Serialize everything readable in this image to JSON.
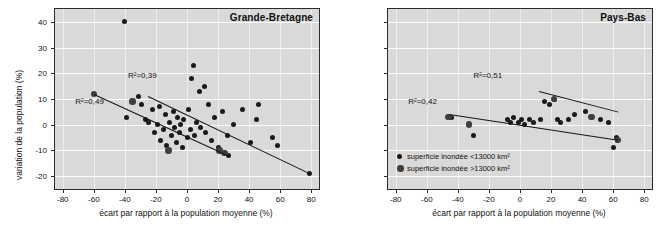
{
  "chart_data": [
    {
      "type": "scatter",
      "title": "Grande-Bretagne",
      "xlabel": "écart par rapport à la population moyenne (%)",
      "ylabel": "variation de la population (%)",
      "xlim": [
        -85,
        85
      ],
      "ylim": [
        -25,
        45
      ],
      "xticks": [
        -80,
        -60,
        -40,
        -20,
        0,
        20,
        40,
        60,
        80
      ],
      "xticklabels": [
        "-80",
        "-60",
        "-40",
        "-20",
        "0",
        "20",
        "40",
        "60",
        "80"
      ],
      "yticks": [
        -20,
        -10,
        0,
        10,
        20,
        30,
        40
      ],
      "yticklabels": [
        "-20",
        "-10",
        "0",
        "10",
        "20",
        "30",
        "40"
      ],
      "grid": true,
      "legend": "none",
      "series": [
        {
          "name": "superficie inondée <13000 km2",
          "marker": "small",
          "points": [
            [
              -40,
              40
            ],
            [
              -39,
              3
            ],
            [
              -31,
              11
            ],
            [
              -29,
              8
            ],
            [
              -27,
              2
            ],
            [
              -25,
              1
            ],
            [
              -22,
              6
            ],
            [
              -21,
              -3
            ],
            [
              -19,
              0
            ],
            [
              -18,
              7
            ],
            [
              -17,
              -6
            ],
            [
              -15,
              -2
            ],
            [
              -14,
              4
            ],
            [
              -13,
              -8
            ],
            [
              -11,
              1
            ],
            [
              -10,
              -4
            ],
            [
              -9,
              5
            ],
            [
              -8,
              -1
            ],
            [
              -7,
              -7
            ],
            [
              -6,
              3
            ],
            [
              -5,
              -3
            ],
            [
              -4,
              0
            ],
            [
              -3,
              -9
            ],
            [
              -2,
              2
            ],
            [
              0,
              -5
            ],
            [
              1,
              6
            ],
            [
              2,
              -2
            ],
            [
              3,
              18
            ],
            [
              4,
              23
            ],
            [
              5,
              -4
            ],
            [
              6,
              1
            ],
            [
              8,
              13
            ],
            [
              9,
              -1
            ],
            [
              11,
              15
            ],
            [
              12,
              -3
            ],
            [
              14,
              8
            ],
            [
              16,
              -6
            ],
            [
              18,
              3
            ],
            [
              20,
              -9
            ],
            [
              23,
              5
            ],
            [
              26,
              -4
            ],
            [
              27,
              -12
            ],
            [
              30,
              0
            ],
            [
              36,
              6
            ],
            [
              41,
              -7
            ],
            [
              45,
              2
            ],
            [
              46,
              8
            ],
            [
              55,
              -5
            ],
            [
              58,
              -8
            ],
            [
              79,
              -19
            ]
          ]
        },
        {
          "name": "superficie inondée >13000 km2",
          "marker": "large",
          "points": [
            [
              -60,
              12
            ],
            [
              -35,
              9
            ],
            [
              -12,
              -10
            ],
            [
              21,
              -10
            ],
            [
              24,
              -11
            ]
          ]
        }
      ],
      "trendlines": [
        {
          "label": "R²=0,49",
          "label_x": -72,
          "label_y": 9,
          "x1": -60,
          "y1": 12,
          "x2": 27,
          "y2": -12
        },
        {
          "label": "R²=0,39",
          "label_x": -38,
          "label_y": 19,
          "x1": -25,
          "y1": 11,
          "x2": 79,
          "y2": -19
        }
      ]
    },
    {
      "type": "scatter",
      "title": "Pays-Bas",
      "xlabel": "écart par rapport à la population moyenne (%)",
      "ylabel": "",
      "xlim": [
        -85,
        85
      ],
      "ylim": [
        -25,
        45
      ],
      "xticks": [
        -80,
        -60,
        -40,
        -20,
        0,
        20,
        40,
        60,
        80
      ],
      "xticklabels": [
        "-80",
        "-60",
        "-40",
        "-20",
        "0",
        "20",
        "40",
        "60",
        "80"
      ],
      "yticks": [
        -20,
        -10,
        0,
        10,
        20,
        30,
        40
      ],
      "yticklabels": [],
      "grid": true,
      "legend": "lower-left",
      "legend_items": [
        "superficie inondée <13000 km²",
        "superficie inondée >13000 km²"
      ],
      "series": [
        {
          "name": "superficie inondée <13000 km2",
          "marker": "small",
          "points": [
            [
              -46,
              3
            ],
            [
              -44,
              3
            ],
            [
              -33,
              0
            ],
            [
              -30,
              -4
            ],
            [
              -8,
              2
            ],
            [
              -6,
              1
            ],
            [
              -4,
              3
            ],
            [
              -1,
              1
            ],
            [
              1,
              2
            ],
            [
              3,
              0
            ],
            [
              6,
              2
            ],
            [
              9,
              1
            ],
            [
              13,
              2
            ],
            [
              16,
              9
            ],
            [
              19,
              8
            ],
            [
              22,
              10
            ],
            [
              24,
              2
            ],
            [
              26,
              1
            ],
            [
              31,
              2
            ],
            [
              35,
              4
            ],
            [
              42,
              5
            ],
            [
              46,
              3
            ],
            [
              52,
              2
            ],
            [
              57,
              1
            ],
            [
              60,
              -9
            ],
            [
              62,
              -5
            ],
            [
              63,
              -6
            ]
          ]
        },
        {
          "name": "superficie inondée >13000 km2",
          "marker": "large",
          "points": [
            [
              -46,
              3
            ],
            [
              -33,
              0
            ],
            [
              22,
              10
            ],
            [
              46,
              3
            ],
            [
              63,
              -6
            ]
          ]
        }
      ],
      "trendlines": [
        {
          "label": "R²=0,51",
          "label_x": -30,
          "label_y": 19,
          "x1": 12,
          "y1": 13,
          "x2": 63,
          "y2": 5
        },
        {
          "label": "R²=0,42",
          "label_x": -72,
          "label_y": 9,
          "x1": -46,
          "y1": 4,
          "x2": 63,
          "y2": -6
        }
      ]
    }
  ]
}
